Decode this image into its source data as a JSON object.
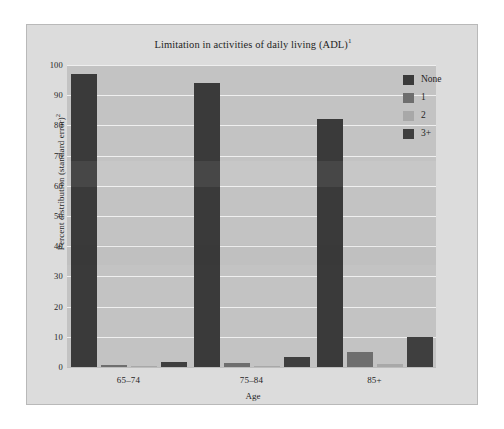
{
  "figure": {
    "title": "Limitation in activities of daily living (ADL)",
    "title_superscript": "1",
    "y_axis_title": "Percent distribution (standard error)",
    "y_axis_title_superscript": "2",
    "x_axis_title": "Age"
  },
  "colors": {
    "card_background": "#dcdcdc",
    "plot_background": "#c3c3c3",
    "gridline": "#efefef",
    "series_none": "#3a3a3a",
    "series_1": "#6e6e6e",
    "series_2": "#a8a8a8",
    "series_3plus": "#3f3f3f",
    "text": "#1f1f1f"
  },
  "chart_data": {
    "type": "bar",
    "xlabel": "Age",
    "ylabel": "Percent distribution (standard error)²",
    "categories": [
      "65–74",
      "75–84",
      "85+"
    ],
    "ylim": [
      0,
      100
    ],
    "yticks": [
      0,
      10,
      20,
      30,
      40,
      50,
      60,
      70,
      80,
      90,
      100
    ],
    "ytick_labels": [
      "0",
      "10",
      "20",
      "30",
      "40",
      "50",
      "60",
      "70",
      "80",
      "90",
      "100"
    ],
    "grid": true,
    "legend_position": "top-right",
    "series": [
      {
        "name": "None",
        "color": "#3a3a3a",
        "values": [
          97,
          94,
          82
        ]
      },
      {
        "name": "1",
        "color": "#6e6e6e",
        "values": [
          0.6,
          1.3,
          5
        ]
      },
      {
        "name": "2",
        "color": "#a8a8a8",
        "values": [
          0.3,
          0.4,
          1
        ]
      },
      {
        "name": "3+",
        "color": "#3f3f3f",
        "values": [
          1.6,
          3.4,
          10
        ]
      }
    ]
  },
  "legend": {
    "items": [
      {
        "label": "None",
        "color": "#3a3a3a"
      },
      {
        "label": "1",
        "color": "#6e6e6e"
      },
      {
        "label": "2",
        "color": "#a8a8a8"
      },
      {
        "label": "3+",
        "color": "#3f3f3f"
      }
    ]
  }
}
